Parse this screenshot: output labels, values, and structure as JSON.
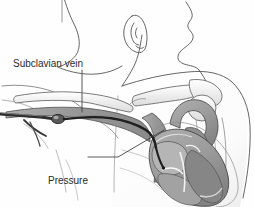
{
  "figure": {
    "background_color": "#fefefe",
    "ink_color": "#3a3a3a",
    "label_color": "#2b2b2b",
    "shade_mid": "#9a9a9a",
    "shade_light": "#c8c8c8",
    "shade_dark": "#6e6e6e",
    "clipped_caption_top": "",
    "labels": {
      "subclavian_vein": "Subclavian vein",
      "pressure_monitor": {
        "line1": "Pressure",
        "line2": "monitor",
        "line3": "above right",
        "line4": "atrium"
      }
    },
    "parts": [
      "head-profile",
      "ear",
      "neck",
      "shoulder",
      "chest-wall",
      "arm",
      "clavicle",
      "scapula",
      "humeral-head",
      "rib-outline",
      "subclavian-vein",
      "superior-vena-cava",
      "heart",
      "right-atrium",
      "right-ventricle",
      "left-ventricle",
      "aortic-arch",
      "pulmonary-artery",
      "catheter-tubing",
      "catheter-hub",
      "catheter-tip"
    ]
  }
}
